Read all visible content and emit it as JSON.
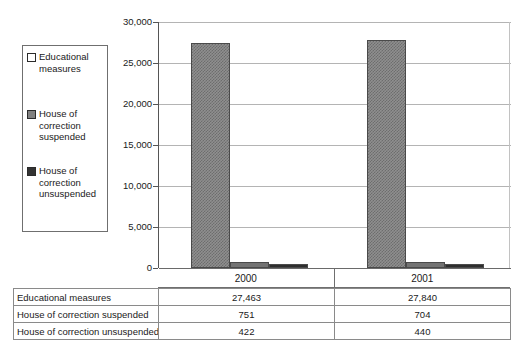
{
  "chart_data": {
    "type": "bar",
    "title": "",
    "subtitle": "",
    "xlabel": "",
    "ylabel": "",
    "categories": [
      "2000",
      "2001"
    ],
    "series": [
      {
        "name": "Educational measures",
        "values": [
          27463,
          27840
        ],
        "color": "#8f8f8f",
        "swatch": "white-hatch"
      },
      {
        "name": "House of correction suspended",
        "values": [
          751,
          704
        ],
        "color": "#737373",
        "swatch": "gray"
      },
      {
        "name": "House of correction unsuspended",
        "values": [
          422,
          440
        ],
        "color": "#2e2e2e",
        "swatch": "dark"
      }
    ],
    "ylim": [
      0,
      30000
    ],
    "ytick_values": [
      30000,
      25000,
      20000,
      15000,
      10000,
      5000,
      0
    ],
    "ytick_labels": [
      "30,000",
      "25,000",
      "20,000",
      "15,000",
      "10,000",
      "5,000",
      "0"
    ],
    "grid": true,
    "legend_position": "left-outside",
    "value_labels_shown": false,
    "data_table": {
      "row_labels": [
        "Educational measures",
        "House of correction suspended",
        "House of correction unsuspended"
      ],
      "column_labels": [
        "2000",
        "2001"
      ],
      "cells": [
        [
          "27,463",
          "27,840"
        ],
        [
          "751",
          "704"
        ],
        [
          "422",
          "440"
        ]
      ]
    }
  },
  "legend": {
    "items": [
      {
        "label": "Educational\nmeasures",
        "swatch": "white"
      },
      {
        "label": "House of\ncorrection\nsuspended",
        "swatch": "gray"
      },
      {
        "label": "House of\ncorrection\nunsuspended",
        "swatch": "dark"
      }
    ]
  },
  "axis": {
    "y_labels": [
      "30,000",
      "25,000",
      "20,000",
      "15,000",
      "10,000",
      "5,000",
      "0"
    ],
    "x_labels": [
      "2000",
      "2001"
    ]
  },
  "colors": {
    "series_1": "#8f8f8f",
    "series_2": "#737373",
    "series_3": "#2e2e2e",
    "gridline": "#b4b4b4",
    "axis": "#555555",
    "table_border": "#8a8a8a"
  }
}
